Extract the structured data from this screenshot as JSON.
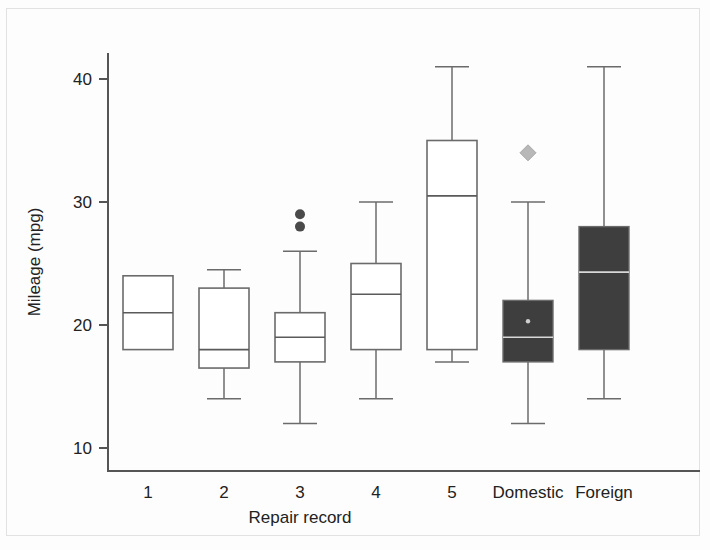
{
  "chart_data": {
    "type": "box",
    "title": "",
    "xlabel": "Repair record",
    "ylabel": "Mileage (mpg)",
    "ylim": [
      8.5,
      42.5
    ],
    "yticks": [
      10,
      20,
      30,
      40
    ],
    "ytick_labels": [
      "10",
      "20",
      "30",
      "40"
    ],
    "grid": false,
    "legend": "none",
    "categories": [
      "1",
      "2",
      "3",
      "4",
      "5",
      "Domestic",
      "Foreign"
    ],
    "boxes": [
      {
        "category": "1",
        "style": "open",
        "whisker_low": null,
        "q1": 18.0,
        "median": 21.0,
        "q3": 24.0,
        "whisker_high": null,
        "outliers": []
      },
      {
        "category": "2",
        "style": "open",
        "whisker_low": 14.0,
        "q1": 16.5,
        "median": 18.0,
        "q3": 23.0,
        "whisker_high": 24.5,
        "outliers": []
      },
      {
        "category": "3",
        "style": "open",
        "whisker_low": 12.0,
        "q1": 17.0,
        "median": 19.0,
        "q3": 21.0,
        "whisker_high": 26.0,
        "outliers": [
          29.0,
          28.0
        ]
      },
      {
        "category": "4",
        "style": "open",
        "whisker_low": 14.0,
        "q1": 18.0,
        "median": 22.5,
        "q3": 25.0,
        "whisker_high": 30.0,
        "outliers": []
      },
      {
        "category": "5",
        "style": "open",
        "whisker_low": 17.0,
        "q1": 18.0,
        "median": 30.5,
        "q3": 35.0,
        "whisker_high": 41.0,
        "outliers": []
      },
      {
        "category": "Domestic",
        "style": "filled",
        "whisker_low": 12.0,
        "q1": 17.0,
        "median": 19.0,
        "q3": 22.0,
        "whisker_high": 30.0,
        "mean": 20.3,
        "outliers_diamond": [
          34.0
        ]
      },
      {
        "category": "Foreign",
        "style": "filled",
        "whisker_low": 14.0,
        "q1": 18.0,
        "median": 24.3,
        "q3": 28.0,
        "whisker_high": 41.0,
        "outliers_diamond": []
      }
    ],
    "colors": {
      "open_box_fill": "#ffffff",
      "filled_box_fill": "#3e3e3e",
      "stroke": "#6b6b6b",
      "axis": "#555555",
      "outlier_dot": "#4a4a4a",
      "outlier_diamond": "#b8b8b8",
      "background": "#fdfdfd"
    }
  }
}
